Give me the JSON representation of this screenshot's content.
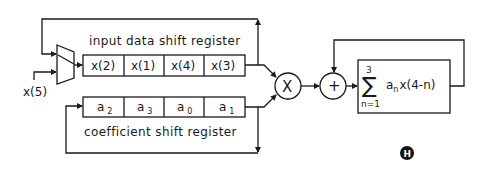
{
  "diagram": {
    "type": "block-diagram",
    "input_register": {
      "label": "input data shift register",
      "cells": [
        "x(2)",
        "x(1)",
        "x(4)",
        "x(3)"
      ]
    },
    "coefficient_register": {
      "label": "coefficient shift register",
      "cells": [
        {
          "base": "a",
          "sub": "2"
        },
        {
          "base": "a",
          "sub": "3"
        },
        {
          "base": "a",
          "sub": "0"
        },
        {
          "base": "a",
          "sub": "1"
        }
      ]
    },
    "new_input": "x(5)",
    "multiplier": {
      "symbol": "X"
    },
    "adder": {
      "symbol": "+"
    },
    "accumulator": {
      "sigma": "∑",
      "upper": "3",
      "lower": "n=1",
      "term_a": "a",
      "term_sub": "n",
      "term_rest": "x(4-n)"
    },
    "badge": {
      "letter": "H"
    }
  }
}
